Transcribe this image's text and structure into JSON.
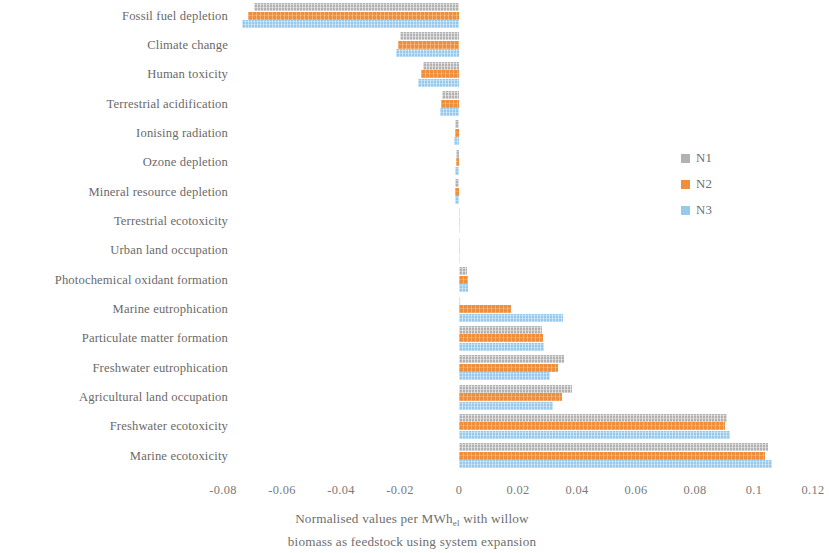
{
  "chart_data": {
    "type": "bar",
    "orientation": "horizontal",
    "title": "",
    "xlabel_line1": "Normalised values per MWh",
    "xlabel_sub": "el",
    "xlabel_line1_tail": " with willow",
    "xlabel_line2": "biomass as feedstock using system expansion",
    "ylabel": "",
    "xlim": [
      -0.09,
      0.125
    ],
    "xticks": [
      -0.08,
      -0.06,
      -0.04,
      -0.02,
      0,
      0.02,
      0.04,
      0.06,
      0.08,
      0.1,
      0.12
    ],
    "xtick_labels": [
      "-0.08",
      "-0.06",
      "-0.04",
      "-0.02",
      "0",
      "0.02",
      "0.04",
      "0.06",
      "0.08",
      "0.1",
      "0.12"
    ],
    "grid": false,
    "legend_position": "right",
    "categories": [
      "Fossil fuel depletion",
      "Climate change",
      "Human toxicity",
      "Terrestrial acidification",
      "Ionising radiation",
      "Ozone depletion",
      "Mineral resource depletion",
      "Terrestrial ecotoxicity",
      "Urban land occupation",
      "Photochemical oxidant formation",
      "Marine eutrophication",
      "Particulate matter formation",
      "Freshwater eutrophication",
      "Agricultural land occupation",
      "Freshwater ecotoxicity",
      "Marine ecotoxicity"
    ],
    "series": [
      {
        "name": "N1",
        "color": "#b2b2b2",
        "values": [
          -0.0695,
          -0.02,
          -0.0122,
          -0.0058,
          -0.0014,
          -0.001,
          -0.0012,
          0.0,
          0.0,
          0.0028,
          0.0005,
          0.0283,
          0.0356,
          0.0382,
          0.091,
          0.1047
        ]
      },
      {
        "name": "N2",
        "color": "#ef8f3c",
        "values": [
          -0.0715,
          -0.0207,
          -0.013,
          -0.0062,
          -0.0015,
          -0.0011,
          -0.0013,
          0.0,
          0.0,
          0.003,
          0.0175,
          0.0285,
          0.0336,
          0.0348,
          0.09,
          0.1038
        ]
      },
      {
        "name": "N3",
        "color": "#96c9ec",
        "values": [
          -0.0735,
          -0.0214,
          -0.0138,
          -0.0066,
          -0.0016,
          -0.0012,
          -0.0014,
          0.0,
          0.0,
          0.0032,
          0.0352,
          0.0287,
          0.031,
          0.0318,
          0.0918,
          0.106
        ]
      }
    ]
  },
  "legend": {
    "items": [
      {
        "label": "N1",
        "color": "#b2b2b2"
      },
      {
        "label": "N2",
        "color": "#ef8f3c"
      },
      {
        "label": "N3",
        "color": "#96c9ec"
      }
    ]
  }
}
